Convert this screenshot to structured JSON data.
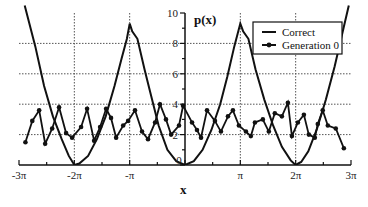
{
  "chart_data": {
    "type": "line",
    "title": "",
    "xlabel": "x",
    "ylabel": "p(x)",
    "xlim": [
      -9.4248,
      9.4248
    ],
    "ylim": [
      0,
      10
    ],
    "x_tick_labels": [
      "-3π",
      "-2π",
      "-π",
      "0",
      "π",
      "2π",
      "3π"
    ],
    "x_tick_values": [
      -9.4248,
      -6.2832,
      -3.1416,
      0,
      3.1416,
      6.2832,
      9.4248
    ],
    "y_tick_labels": [
      "0",
      "2",
      "4",
      "6",
      "8",
      "10"
    ],
    "y_tick_values": [
      0,
      2,
      4,
      6,
      8,
      10
    ],
    "grid": {
      "horizontal": [
        2,
        4,
        6,
        8
      ],
      "vertical": [
        -6.2832,
        -3.1416,
        3.1416,
        6.2832
      ],
      "style": "dotted"
    },
    "legend": {
      "position": "upper right",
      "entries": [
        "Correct",
        "Generation 0"
      ]
    },
    "series": [
      {
        "name": "Correct",
        "marker": "none",
        "x": [
          -9.1,
          -8.5,
          -8.0,
          -7.5,
          -7.0,
          -6.6,
          -6.28,
          -6.0,
          -5.5,
          -5.0,
          -4.5,
          -4.0,
          -3.6,
          -3.3,
          -3.14,
          -3.0,
          -2.7,
          -2.3,
          -2.0,
          -1.5,
          -1.0,
          -0.5,
          0.0,
          0.5,
          1.0,
          1.5,
          2.0,
          2.4,
          2.8,
          3.14,
          3.3,
          3.6,
          4.0,
          4.5,
          5.0,
          5.5,
          6.0,
          6.28,
          6.6,
          7.0,
          7.5,
          8.0,
          8.5,
          9.0,
          9.3
        ],
        "y": [
          10.5,
          7.8,
          5.2,
          3.2,
          1.7,
          0.6,
          0.0,
          0.1,
          0.6,
          1.7,
          3.2,
          5.2,
          7.0,
          8.3,
          9.3,
          8.8,
          8.3,
          6.3,
          4.9,
          2.6,
          1.0,
          0.25,
          0.0,
          0.25,
          1.0,
          2.3,
          4.0,
          5.8,
          7.8,
          9.3,
          8.8,
          8.3,
          6.3,
          4.3,
          2.6,
          1.2,
          0.3,
          0.0,
          0.2,
          0.9,
          2.4,
          4.3,
          6.5,
          9.0,
          10.5
        ]
      },
      {
        "name": "Generation 0",
        "marker": "circle",
        "x": [
          -9.06,
          -8.67,
          -8.28,
          -7.94,
          -7.54,
          -7.15,
          -6.75,
          -6.41,
          -5.9,
          -5.56,
          -5.16,
          -4.82,
          -4.48,
          -4.2,
          -3.91,
          -3.51,
          -3.23,
          -2.84,
          -2.44,
          -2.1,
          -1.7,
          -1.42,
          -1.08,
          -0.79,
          -0.34,
          -0.11,
          0.4,
          0.68,
          0.91,
          1.25,
          1.7,
          2.04,
          2.44,
          2.72,
          3.06,
          3.46,
          3.74,
          3.97,
          4.42,
          4.76,
          5.1,
          5.5,
          5.84,
          6.07,
          6.41,
          6.75,
          7.03,
          7.37,
          7.54,
          7.82,
          8.11,
          8.56,
          9.02
        ],
        "y": [
          1.5,
          2.9,
          3.6,
          1.4,
          2.4,
          3.8,
          2.1,
          1.8,
          2.5,
          3.7,
          1.6,
          2.5,
          3.7,
          3.1,
          1.8,
          2.6,
          2.9,
          3.6,
          2.2,
          1.7,
          2.8,
          4.0,
          3.0,
          2.0,
          2.6,
          3.9,
          2.8,
          2.3,
          1.8,
          3.6,
          2.9,
          2.2,
          3.2,
          3.6,
          2.6,
          2.2,
          1.9,
          2.8,
          3.0,
          2.2,
          3.4,
          3.2,
          4.1,
          1.9,
          2.8,
          3.3,
          2.0,
          1.8,
          2.7,
          3.6,
          2.6,
          2.4,
          1.1
        ]
      }
    ]
  }
}
